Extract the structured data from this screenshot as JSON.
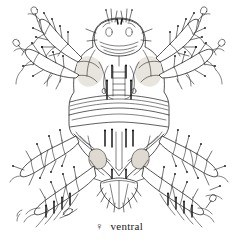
{
  "figure": {
    "view": "ventral",
    "sex_symbol": "♀",
    "caption_text": "ventral",
    "background_color": "#ffffff",
    "ink_color": "#1a1a1a",
    "shading_color": "#d8d4cc",
    "canvas": {
      "width": 238,
      "height": 251
    }
  },
  "caption": {
    "sex": "♀",
    "label": "ventral"
  },
  "anatomy": {
    "gnathosoma": {
      "name": "gnathosoma",
      "position": "top-center"
    },
    "idiosoma": {
      "name": "idiosoma",
      "position": "center"
    },
    "sternal_plate": {
      "name": "sternal-plate",
      "position": "upper-center"
    },
    "genital_region": {
      "name": "genital-region",
      "position": "lower-center"
    },
    "anal_plate": {
      "name": "anal-plate",
      "position": "bottom-center"
    },
    "striae_bands": {
      "name": "transverse-striae",
      "count": 4
    },
    "legs": [
      {
        "id": "I",
        "side": "left",
        "label": "leg-i-left"
      },
      {
        "id": "I",
        "side": "right",
        "label": "leg-i-right"
      },
      {
        "id": "II",
        "side": "left",
        "label": "leg-ii-left"
      },
      {
        "id": "II",
        "side": "right",
        "label": "leg-ii-right"
      },
      {
        "id": "III",
        "side": "left",
        "label": "leg-iii-left"
      },
      {
        "id": "III",
        "side": "right",
        "label": "leg-iii-right"
      },
      {
        "id": "IV",
        "side": "left",
        "label": "leg-iv-left"
      },
      {
        "id": "IV",
        "side": "right",
        "label": "leg-iv-right"
      }
    ]
  }
}
